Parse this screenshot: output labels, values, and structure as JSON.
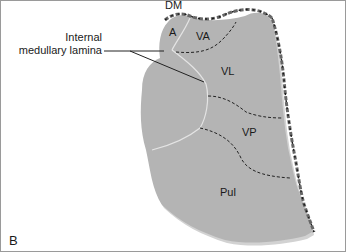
{
  "figure": {
    "panel_label": "B",
    "callout": {
      "line1": "Internal",
      "line2": "medullary lamina"
    },
    "regions": [
      {
        "id": "A",
        "label": "A"
      },
      {
        "id": "VA",
        "label": "VA"
      },
      {
        "id": "VL",
        "label": "VL"
      },
      {
        "id": "DM",
        "label": "DM"
      },
      {
        "id": "VP",
        "label": "VP"
      },
      {
        "id": "Pul",
        "label": "Pul"
      }
    ],
    "colors": {
      "thalamus_fill": "#b4b4b4",
      "shadow_fill": "#d0d0d0",
      "dashed_boundary": "#222222",
      "lamina_line": "#e6e6e6",
      "leader_line": "#222222",
      "border": "#9a9a9a"
    }
  }
}
